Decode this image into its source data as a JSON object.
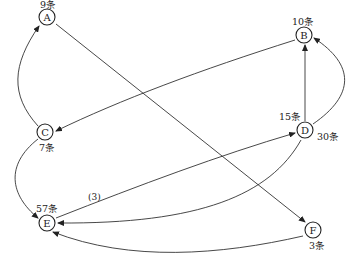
{
  "diagram": {
    "nodes": [
      {
        "id": "A",
        "label": "A",
        "count": "9条"
      },
      {
        "id": "B",
        "label": "B",
        "count": "10条"
      },
      {
        "id": "C",
        "label": "C",
        "count": "7条"
      },
      {
        "id": "D",
        "label": "D",
        "count_top": "15条",
        "count_right": "30条"
      },
      {
        "id": "E",
        "label": "E",
        "count": "57条"
      },
      {
        "id": "F",
        "label": "F",
        "count": "3条"
      }
    ],
    "edges": [
      {
        "from": "C",
        "to": "A"
      },
      {
        "from": "A",
        "to": "F"
      },
      {
        "from": "B",
        "to": "C"
      },
      {
        "from": "D",
        "to": "B",
        "style": "straight"
      },
      {
        "from": "D",
        "to": "B",
        "style": "curve"
      },
      {
        "from": "E",
        "to": "D",
        "label": "(3)"
      },
      {
        "from": "D",
        "to": "E"
      },
      {
        "from": "F",
        "to": "E"
      },
      {
        "from": "C",
        "to": "E"
      }
    ],
    "edge_label_ED": "(3)"
  }
}
